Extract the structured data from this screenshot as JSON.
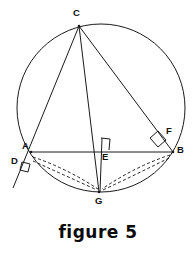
{
  "figure": {
    "caption": "figure 5",
    "stroke_color": "#1a1a1a",
    "background": "#ffffff",
    "labels": {
      "A": "A",
      "B": "B",
      "C": "C",
      "D": "D",
      "E": "E",
      "F": "F",
      "G": "G"
    },
    "label_positions": {
      "A": {
        "x": 22,
        "y": 145
      },
      "B": {
        "x": 177,
        "y": 148
      },
      "C": {
        "x": 73,
        "y": 8
      },
      "D": {
        "x": 11,
        "y": 159
      },
      "E": {
        "x": 101,
        "y": 153
      },
      "F": {
        "x": 166,
        "y": 128
      },
      "G": {
        "x": 95,
        "y": 195
      }
    },
    "circle": {
      "cx": 101,
      "cy": 108,
      "r": 84
    },
    "points": {
      "A": {
        "x": 31,
        "y": 152
      },
      "B": {
        "x": 173,
        "y": 152
      },
      "C": {
        "x": 79,
        "y": 26
      },
      "D": {
        "x": 22,
        "y": 166
      },
      "E": {
        "x": 99,
        "y": 152
      },
      "F": {
        "x": 160,
        "y": 139
      },
      "G": {
        "x": 99,
        "y": 192
      },
      "tangent_end": {
        "x": 13,
        "y": 188
      }
    },
    "segments": [
      {
        "name": "chord-AB",
        "from": "A",
        "to": "B",
        "style": "solid"
      },
      {
        "name": "line-CD-through-A",
        "from": "C",
        "to": "tangent_end",
        "style": "solid"
      },
      {
        "name": "chord-CG-through-E",
        "from": "C",
        "to": "G",
        "style": "solid"
      },
      {
        "name": "chord-CB",
        "from": "C",
        "to": "B",
        "style": "solid"
      },
      {
        "name": "segment-EG",
        "from": "E",
        "to": "G",
        "style": "solid"
      }
    ],
    "dashed_segments": [
      {
        "name": "dashed-A-to-G-upper",
        "from": "A",
        "to": "G"
      },
      {
        "name": "dashed-A-to-G-lower",
        "from": "A",
        "to": "G"
      },
      {
        "name": "dashed-B-to-G-upper",
        "from": "B",
        "to": "G"
      },
      {
        "name": "dashed-B-to-G-lower",
        "from": "B",
        "to": "G"
      }
    ],
    "right_angle_marks": [
      {
        "name": "right-angle-at-E",
        "at": "E"
      },
      {
        "name": "right-angle-at-F",
        "at": "F"
      },
      {
        "name": "right-angle-at-D",
        "at": "D"
      }
    ]
  }
}
